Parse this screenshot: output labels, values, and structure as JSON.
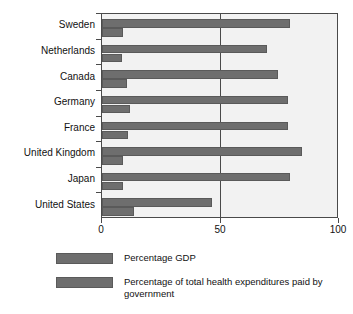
{
  "chart_data": {
    "type": "bar",
    "orientation": "horizontal",
    "title": "",
    "xlabel": "",
    "ylabel": "",
    "xlim": [
      0,
      100
    ],
    "xticks": [
      0,
      50,
      100
    ],
    "xtick_labels": [
      "0",
      "50",
      "100"
    ],
    "grid": "vertical gridline at 50 only",
    "legend_position": "below-left",
    "categories": [
      "Sweden",
      "Netherlands",
      "Canada",
      "Germany",
      "France",
      "United Kingdom",
      "Japan",
      "United States"
    ],
    "series": [
      {
        "name": "Percentage of total health expenditures paid by government",
        "color": "#6e6e6e",
        "values": [
          80,
          70,
          75,
          79,
          79,
          85,
          80,
          47
        ]
      },
      {
        "name": "Percentage GDP",
        "color": "#6e6e6e",
        "values": [
          9,
          8.5,
          10.5,
          12,
          11,
          9,
          9,
          13.5
        ]
      }
    ]
  },
  "axis": {
    "x_tick_labels": [
      "0",
      "50",
      "100"
    ]
  },
  "legend": {
    "items": [
      {
        "label": "Percentage GDP",
        "color": "#6e6e6e"
      },
      {
        "label": "Percentage of total health expenditures paid by government",
        "color": "#6e6e6e"
      }
    ]
  },
  "colors": {
    "bar": "#6e6e6e",
    "bar_border": "#5a5a5a",
    "plot_background": "#f2f2f2",
    "axis": "#4a4a4a",
    "text": "#111111"
  }
}
